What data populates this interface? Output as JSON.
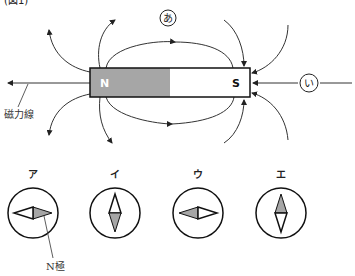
{
  "figure": {
    "caption_partial": "(図1)",
    "magnet": {
      "north_label": "N",
      "south_label": "S",
      "north_fill": "#a6a6a6",
      "south_fill": "#ffffff"
    },
    "markers": {
      "a": "あ",
      "i": "い"
    },
    "field_line_label": "磁力線"
  },
  "compasses": {
    "items": [
      {
        "label": "ア",
        "orientation": "horizontal",
        "north_direction": "right"
      },
      {
        "label": "イ",
        "orientation": "vertical",
        "north_direction": "down"
      },
      {
        "label": "ウ",
        "orientation": "horizontal",
        "north_direction": "left"
      },
      {
        "label": "エ",
        "orientation": "vertical",
        "north_direction": "up"
      }
    ],
    "north_pole_label": "N極",
    "shade_color": "#a6a6a6"
  }
}
